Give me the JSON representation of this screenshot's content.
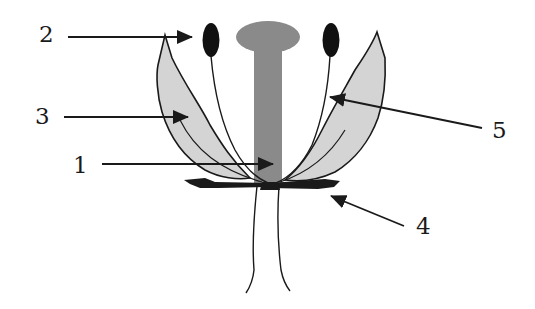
{
  "diagram": {
    "colors": {
      "background": "#ffffff",
      "outline": "#1a1a1a",
      "pistil": "#8a8a8a",
      "petal": "#d4d4d4",
      "anther": "#111111",
      "sepal": "#1a1a1a"
    },
    "labels": [
      {
        "id": "1",
        "text": "1",
        "points_to": "pistil-style"
      },
      {
        "id": "2",
        "text": "2",
        "points_to": "anther"
      },
      {
        "id": "3",
        "text": "3",
        "points_to": "petal"
      },
      {
        "id": "4",
        "text": "4",
        "points_to": "sepal"
      },
      {
        "id": "5",
        "text": "5",
        "points_to": "filament"
      }
    ]
  }
}
